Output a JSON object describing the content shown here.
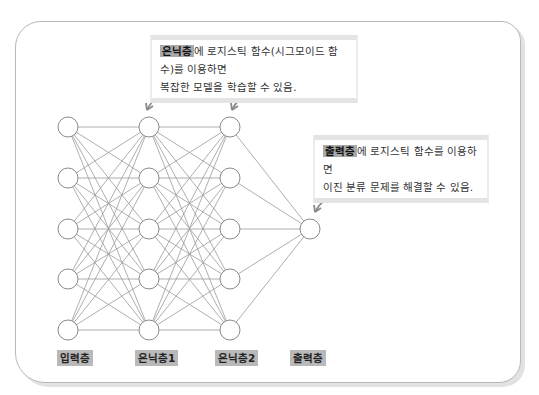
{
  "callouts": {
    "hidden": {
      "highlight": "은닉층",
      "line1_rest": "에 로지스틱 함수(시그모이드 함수)를 이용하면",
      "line2": "복잡한 모델을 학습할 수 있음."
    },
    "output": {
      "highlight": "출력층",
      "line1_rest": "에 로지스틱 함수를 이용하면",
      "line2": "이진 분류 문제를 해결할 수 있음."
    }
  },
  "layers": [
    {
      "label": "입력층",
      "nodes": 5
    },
    {
      "label": "은닉층1",
      "nodes": 5
    },
    {
      "label": "은닉층2",
      "nodes": 5
    },
    {
      "label": "출력층",
      "nodes": 1
    }
  ],
  "colors": {
    "highlight": "#a9a9a9",
    "label_bg": "#b9b9b9",
    "line": "#8c8c8c",
    "frame": "#b8b8b8"
  }
}
